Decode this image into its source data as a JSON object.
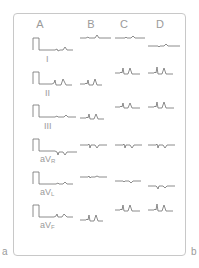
{
  "figure": {
    "columns": [
      {
        "label": "A",
        "x": 40
      },
      {
        "label": "B",
        "x": 91
      },
      {
        "label": "C",
        "x": 124
      },
      {
        "label": "D",
        "x": 160
      }
    ],
    "leads": [
      {
        "label": "I",
        "label_x": 47,
        "label_y": 57,
        "baseline": 50
      },
      {
        "label": "II",
        "label_x": 46,
        "label_y": 91,
        "baseline": 84
      },
      {
        "label": "III",
        "label_x": 45,
        "label_y": 124,
        "baseline": 117
      },
      {
        "label": "aVR",
        "label_main": "aV",
        "label_sub": "R",
        "label_x": 43,
        "label_y": 157,
        "baseline": 151
      },
      {
        "label": "aVL",
        "label_main": "aV",
        "label_sub": "L",
        "label_x": 43,
        "label_y": 190,
        "baseline": 184
      },
      {
        "label": "aVF",
        "label_main": "aV",
        "label_sub": "F",
        "label_x": 43,
        "label_y": 223,
        "baseline": 217
      }
    ],
    "panel_labels": {
      "left": "a",
      "right": "b"
    },
    "colors": {
      "trace": "#6e6e6e",
      "frame": "#c8c8c8",
      "text": "#9a9a9a"
    }
  }
}
